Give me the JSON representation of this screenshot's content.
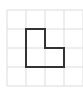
{
  "diagram": {
    "type": "grid-polygon",
    "grid": {
      "rows": 4,
      "cols": 4,
      "origin_x": 7,
      "origin_y": 10,
      "cell_size": 19,
      "line_color": "#dcdcdc"
    },
    "shape": {
      "name": "L-shape",
      "stroke_color": "#333333",
      "stroke_width": 2,
      "grid_vertices": [
        [
          1,
          1
        ],
        [
          2,
          1
        ],
        [
          2,
          2
        ],
        [
          3,
          2
        ],
        [
          3,
          3
        ],
        [
          1,
          3
        ]
      ],
      "points": "26,29 45,29 45,48 64,48 64,67 26,67"
    }
  }
}
